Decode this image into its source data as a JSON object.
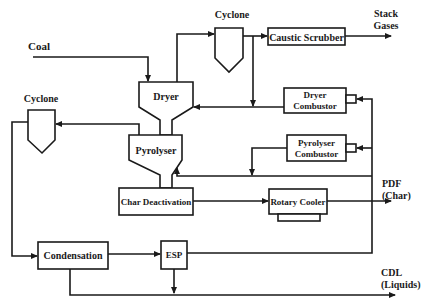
{
  "diagram": {
    "type": "process-flow",
    "colors": {
      "stroke": "#1a1a1a",
      "background": "#ffffff"
    },
    "inputs": {
      "coal": "Coal"
    },
    "units": {
      "cyclone_top": "Cyclone",
      "cyclone_left": "Cyclone",
      "caustic_scrubber": "Caustic Scrubber",
      "dryer": "Dryer",
      "dryer_combustor_line1": "Dryer",
      "dryer_combustor_line2": "Combustor",
      "pyrolyser": "Pyrolyser",
      "pyrolyser_combustor_line1": "Pyrolyser",
      "pyrolyser_combustor_line2": "Combustor",
      "char_deactivation": "Char Deactivation",
      "rotary_cooler": "Rotary Cooler",
      "condensation": "Condensation",
      "esp": "ESP"
    },
    "outputs": {
      "stack_gases_line1": "Stack",
      "stack_gases_line2": "Gases",
      "pdf_line1": "PDF",
      "pdf_line2": "(Char)",
      "cdl_line1": "CDL",
      "cdl_line2": "(Liquids)"
    },
    "flows": [
      {
        "from": "Coal",
        "to": "Dryer"
      },
      {
        "from": "Dryer",
        "to": "Cyclone (top)"
      },
      {
        "from": "Cyclone (top)",
        "to": "Caustic Scrubber"
      },
      {
        "from": "Caustic Scrubber",
        "to": "Stack Gases"
      },
      {
        "from": "Cyclone (top)",
        "to": "Dryer"
      },
      {
        "from": "Dryer Combustor",
        "to": "Dryer"
      },
      {
        "from": "Dryer",
        "to": "Pyrolyser"
      },
      {
        "from": "Pyrolyser",
        "to": "Cyclone (left)"
      },
      {
        "from": "Pyrolyser Combustor",
        "to": "Pyrolyser"
      },
      {
        "from": "Pyrolyser",
        "to": "Char Deactivation"
      },
      {
        "from": "Char Deactivation",
        "to": "Rotary Cooler"
      },
      {
        "from": "Rotary Cooler",
        "to": "PDF (Char)"
      },
      {
        "from": "Cyclone (left)",
        "to": "Condensation"
      },
      {
        "from": "Condensation",
        "to": "ESP"
      },
      {
        "from": "ESP",
        "to": "Dryer Combustor / Pyrolyser Combustor"
      },
      {
        "from": "ESP",
        "to": "CDL (Liquids)"
      },
      {
        "from": "Condensation",
        "to": "CDL (Liquids)"
      }
    ]
  }
}
